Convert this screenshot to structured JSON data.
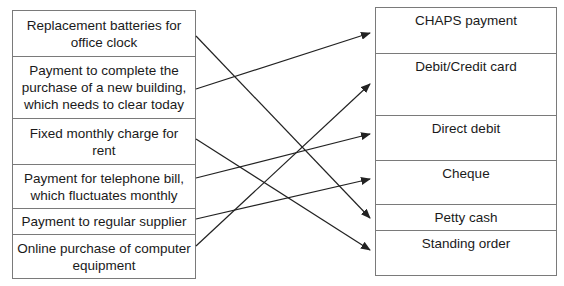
{
  "diagram": {
    "top_text_fragment": "match the payment",
    "left_items": [
      {
        "label": "Replacement batteries for office clock"
      },
      {
        "label": "Payment to complete the purchase of a new building, which needs to clear today"
      },
      {
        "label": "Fixed monthly charge for rent"
      },
      {
        "label": "Payment for telephone bill, which fluctuates monthly"
      },
      {
        "label": "Payment to regular supplier"
      },
      {
        "label": "Online purchase of computer equipment"
      }
    ],
    "right_items": [
      {
        "label": "CHAPS payment"
      },
      {
        "label": "Debit/Credit card"
      },
      {
        "label": "Direct debit"
      },
      {
        "label": "Cheque"
      },
      {
        "label": "Petty cash"
      },
      {
        "label": "Standing order"
      }
    ],
    "connections": [
      {
        "from": "Replacement batteries for office clock",
        "to": "Petty cash"
      },
      {
        "from": "Payment to complete the purchase of a new building, which needs to clear today",
        "to": "CHAPS payment"
      },
      {
        "from": "Fixed monthly charge for rent",
        "to": "Standing order"
      },
      {
        "from": "Payment for telephone bill, which fluctuates monthly",
        "to": "Direct debit"
      },
      {
        "from": "Payment to regular supplier",
        "to": "Cheque"
      },
      {
        "from": "Online purchase of computer equipment",
        "to": "Debit/Credit card"
      }
    ],
    "line_color": "#222222",
    "border_color": "#7a7a7a"
  }
}
